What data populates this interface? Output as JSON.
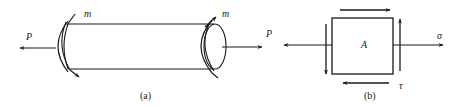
{
  "figure_a": {
    "caption": "(a)",
    "force_left_label": "P",
    "force_right_label": "P",
    "moment_left_label": "m",
    "moment_right_label": "m",
    "description": "Cylindrical bar under axial tension P and torsion m"
  },
  "figure_b": {
    "caption": "(b)",
    "element_label": "A",
    "normal_stress_label": "σ",
    "shear_stress_label": "τ",
    "description": "Stress element A with normal stress σ and shear stress τ"
  },
  "colors": {
    "stroke": "#1a1a1a",
    "background": "#ffffff"
  }
}
